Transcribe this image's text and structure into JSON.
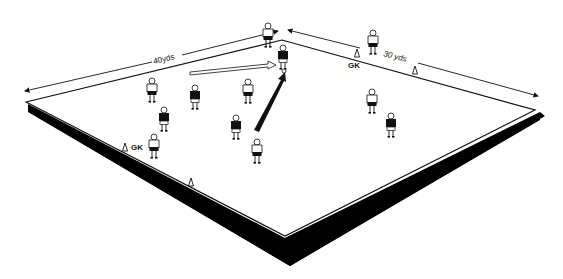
{
  "diagram": {
    "pitch": {
      "length_label": "40yds",
      "width_label": "30 yds",
      "fill": "#ffffff",
      "shadow_color": "#000000"
    },
    "labels": {
      "gk_top": "GK",
      "gk_left": "GK"
    },
    "team_light": {
      "kit": "white shirt, dark shorts",
      "count": 6
    },
    "team_dark": {
      "kit": "dark shirt, white shorts",
      "count": 5
    },
    "arrows": {
      "pass_run": "hollow arrow toward top player",
      "shot_pass": "solid black arrow toward top player"
    },
    "cones": 4
  }
}
